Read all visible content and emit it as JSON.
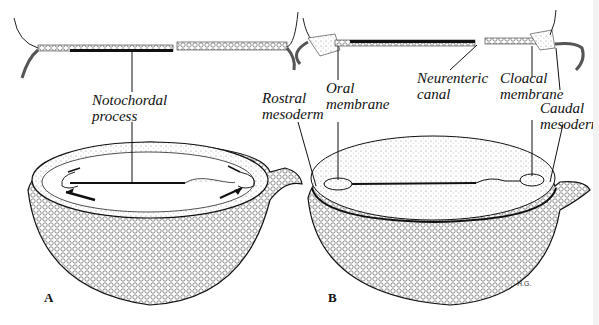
{
  "figure": {
    "panels": [
      {
        "id": "A",
        "label": "A"
      },
      {
        "id": "B",
        "label": "B"
      }
    ],
    "labels": {
      "notochordal_process": [
        "Notochordal",
        "process"
      ],
      "rostral_mesoderm": [
        "Rostral",
        "mesoderm"
      ],
      "oral_membrane": [
        "Oral",
        "membrane"
      ],
      "neurenteric_canal": [
        "Neurenteric",
        "canal"
      ],
      "cloacal_membrane": [
        "Cloacal",
        "membrane"
      ],
      "caudal_mesoderm": [
        "Caudal",
        "mesodern"
      ]
    },
    "signature": "H.G.",
    "colors": {
      "ink": "#111111",
      "background": "#ffffff",
      "stipple": "#9a9a9a"
    }
  }
}
